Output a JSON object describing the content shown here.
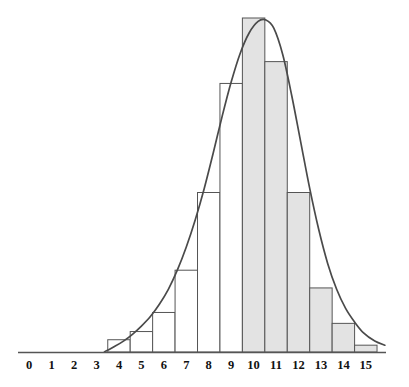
{
  "figure": {
    "kind": "histogram-with-density-curve",
    "background_color": "#ffffff",
    "width": 409,
    "height": 387
  },
  "axis": {
    "line_color": "#555555",
    "baseline_y": 352,
    "x_start": 18,
    "x_end": 386,
    "tick_labels": [
      "0",
      "1",
      "2",
      "3",
      "4",
      "5",
      "6",
      "7",
      "8",
      "9",
      "10",
      "11",
      "12",
      "13",
      "14",
      "15"
    ]
  },
  "bars": {
    "outline_color": "#555555",
    "unshaded_fill": "#ffffff",
    "shaded_fill": "#e3e3e3"
  },
  "curve": {
    "color": "#4a4a4a",
    "width": 1.7
  },
  "chart_data": {
    "type": "bar",
    "title": "",
    "subtitle": "",
    "xlabel": "",
    "ylabel": "",
    "grid": false,
    "legend": "none",
    "xlim": [
      -0.5,
      15.9
    ],
    "ylim": [
      0,
      0.245
    ],
    "categories": [
      "0",
      "1",
      "2",
      "3",
      "4",
      "5",
      "6",
      "7",
      "8",
      "9",
      "10",
      "11",
      "12",
      "13",
      "14",
      "15"
    ],
    "values": [
      0,
      0,
      0,
      0,
      0.009,
      0.015,
      0.029,
      0.06,
      0.117,
      0.197,
      0.245,
      0.213,
      0.117,
      0.047,
      0.021,
      0.005
    ],
    "bar_shaded": [
      false,
      false,
      false,
      false,
      false,
      false,
      false,
      false,
      false,
      false,
      true,
      true,
      true,
      true,
      true,
      true
    ],
    "bar_width_fraction": 1.0,
    "overlay": {
      "type": "line",
      "name": "density-curve",
      "x": [
        3.35,
        3.8,
        4.2,
        4.6,
        5.0,
        5.4,
        5.8,
        6.2,
        6.6,
        7.0,
        7.4,
        7.8,
        8.2,
        8.6,
        9.0,
        9.4,
        9.8,
        10.2,
        10.55,
        10.9,
        11.3,
        11.7,
        12.1,
        12.5,
        12.9,
        13.3,
        13.7,
        14.1,
        14.5,
        14.9,
        15.4,
        15.85
      ],
      "y": [
        0.0,
        0.004,
        0.008,
        0.013,
        0.019,
        0.026,
        0.035,
        0.046,
        0.06,
        0.077,
        0.097,
        0.12,
        0.146,
        0.173,
        0.198,
        0.219,
        0.234,
        0.2425,
        0.2435,
        0.2375,
        0.218,
        0.188,
        0.154,
        0.12,
        0.09,
        0.065,
        0.046,
        0.032,
        0.022,
        0.014,
        0.008,
        0.005
      ]
    }
  }
}
